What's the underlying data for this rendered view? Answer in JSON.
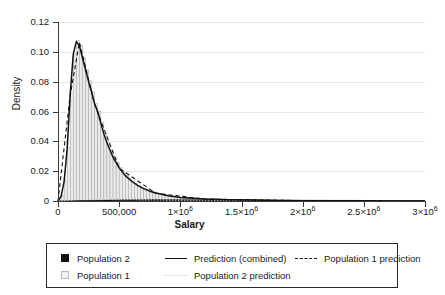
{
  "chart_data": {
    "type": "area",
    "title": "",
    "xlabel": "Salary",
    "ylabel": "Density",
    "xlim": [
      0,
      3000000
    ],
    "ylim": [
      0,
      0.12
    ],
    "grid": true,
    "legend_position": "bottom",
    "x_ticks": [
      0,
      500000,
      1000000,
      1500000,
      2000000,
      2500000,
      3000000
    ],
    "x_tick_labels": [
      "0",
      "500,000",
      "1×10⁶",
      "1.5×10⁶",
      "2×10⁶",
      "2.5×10⁶",
      "3×10⁶"
    ],
    "y_ticks": [
      0,
      0.02,
      0.04,
      0.06,
      0.08,
      0.1,
      0.12
    ],
    "y_tick_labels": [
      "0",
      "0.02",
      "0.04",
      "0.06",
      "0.08",
      "0.10",
      "0.12"
    ],
    "legend": [
      {
        "label": "Population 2",
        "marker": "filled-square",
        "color": "#111111"
      },
      {
        "label": "Population 1",
        "marker": "open-square",
        "color": "#f2f2f2"
      },
      {
        "label": "Prediction (combined)",
        "marker": "solid-line",
        "color": "#111111"
      },
      {
        "label": "Population 2 prediction",
        "marker": "dotted-line",
        "color": "#cfcfcf"
      },
      {
        "label": "Population 1 prediction",
        "marker": "dashed-line",
        "color": "#111111"
      }
    ],
    "histogram": {
      "name": "Population 1",
      "bin_width": 25000,
      "bin_starts": [
        0,
        25000,
        50000,
        75000,
        100000,
        125000,
        150000,
        175000,
        200000,
        225000,
        250000,
        275000,
        300000,
        325000,
        350000,
        375000,
        400000,
        425000,
        450000,
        475000,
        500000,
        525000,
        550000,
        575000,
        600000,
        625000,
        650000,
        675000,
        700000,
        725000,
        750000,
        775000,
        800000,
        825000,
        850000,
        875000,
        900000,
        925000,
        950000,
        975000,
        1000000,
        1100000,
        1200000,
        1300000,
        1400000,
        1500000,
        1600000,
        1700000,
        1800000,
        1900000,
        2000000,
        2200000,
        2400000,
        2600000,
        2800000,
        3000000
      ],
      "densities": [
        0.0,
        0.0035,
        0.014,
        0.036,
        0.073,
        0.0985,
        0.1075,
        0.1045,
        0.0965,
        0.0882,
        0.0805,
        0.0732,
        0.0655,
        0.06,
        0.0525,
        0.0452,
        0.0392,
        0.034,
        0.0295,
        0.0258,
        0.0223,
        0.0195,
        0.0172,
        0.0152,
        0.0135,
        0.012,
        0.0106,
        0.0094,
        0.0084,
        0.0075,
        0.0067,
        0.006,
        0.0054,
        0.0048,
        0.0043,
        0.0039,
        0.0035,
        0.0031,
        0.0028,
        0.0025,
        0.0023,
        0.0018,
        0.0014,
        0.0011,
        0.0009,
        0.0007,
        0.0006,
        0.0005,
        0.0004,
        0.0003,
        0.00025,
        0.0002,
        0.00015,
        0.0001,
        5e-05,
        0.0
      ]
    },
    "series": [
      {
        "name": "Prediction (combined)",
        "style": "solid",
        "color": "#111111",
        "x": [
          0,
          25000,
          50000,
          75000,
          100000,
          125000,
          150000,
          175000,
          200000,
          225000,
          250000,
          275000,
          300000,
          325000,
          350000,
          375000,
          400000,
          450000,
          500000,
          550000,
          600000,
          650000,
          700000,
          750000,
          800000,
          900000,
          1000000,
          1200000,
          1400000,
          1600000,
          1800000,
          2000000,
          2400000,
          2800000,
          3000000
        ],
        "y": [
          0.0,
          0.003,
          0.013,
          0.035,
          0.072,
          0.0985,
          0.107,
          0.104,
          0.096,
          0.088,
          0.08,
          0.073,
          0.065,
          0.0598,
          0.0522,
          0.045,
          0.039,
          0.0293,
          0.0222,
          0.017,
          0.0134,
          0.0105,
          0.0083,
          0.0066,
          0.0053,
          0.0035,
          0.0023,
          0.0014,
          0.0009,
          0.0006,
          0.0004,
          0.00025,
          0.00015,
          5e-05,
          0.0
        ]
      },
      {
        "name": "Population 1 prediction",
        "style": "dashed",
        "color": "#111111",
        "x": [
          0,
          100000,
          175000,
          300000,
          500000,
          800000,
          1200000,
          2000000,
          3000000
        ],
        "y": [
          0.0,
          0.071,
          0.1065,
          0.0645,
          0.022,
          0.0052,
          0.0013,
          0.00024,
          0.0
        ]
      },
      {
        "name": "Population 2 prediction",
        "style": "dotted",
        "color": "#cfcfcf",
        "x": [
          0,
          200000,
          500000,
          900000,
          1400000,
          2000000,
          3000000
        ],
        "y": [
          0.0,
          0.0012,
          0.0009,
          0.0006,
          0.0004,
          0.0002,
          0.0
        ]
      },
      {
        "name": "Population 2",
        "style": "baseline-band",
        "color": "#111111",
        "x": [
          0,
          500000,
          800000,
          1200000,
          2000000,
          3000000
        ],
        "y": [
          0.0,
          0.0008,
          0.001,
          0.0008,
          0.0005,
          0.0002
        ]
      }
    ]
  },
  "axes": {
    "ylabel_title": "Density",
    "xlabel_title": "Salary"
  },
  "legend_rows": [
    [
      {
        "label": "Population 2",
        "marker": "filled-square"
      },
      {
        "label": "Prediction (combined)",
        "marker": "solid-line"
      },
      {
        "label": "Population 1 prediction",
        "marker": "dashed-line"
      }
    ],
    [
      {
        "label": "Population 1",
        "marker": "open-square"
      },
      {
        "label": "Population 2 prediction",
        "marker": "dotted-line"
      }
    ]
  ]
}
